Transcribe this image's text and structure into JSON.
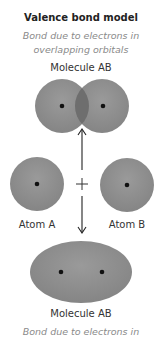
{
  "title": "Valence bond model",
  "subtitle_lines": [
    "Bond due to electrons in",
    "overlapping orbitals"
  ],
  "top_label": "Molecule AB",
  "atom_a_label": "Atom A",
  "atom_b_label": "Atom B",
  "plus_symbol": "+",
  "bottom_label": "Molecule AB",
  "bottom_caption": "Bond due to electrons in",
  "colors": {
    "orbital": "#8c8c8c",
    "overlap": "#6e6e6e",
    "nucleus": "#111111",
    "arrow": "#222222"
  }
}
